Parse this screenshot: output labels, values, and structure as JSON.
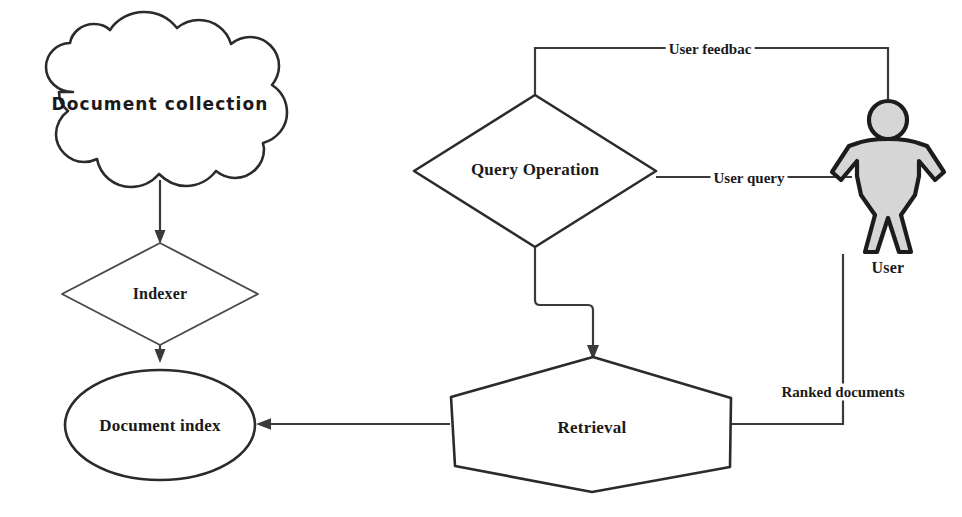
{
  "diagram": {
    "background_color": "#ffffff",
    "stroke_color": "#2b2b2b",
    "person_fill_color": "#d6d6d6",
    "nodes": {
      "document_collection": {
        "label": "Document collection",
        "shape": "cloud"
      },
      "indexer": {
        "label": "Indexer",
        "shape": "diamond"
      },
      "document_index": {
        "label": "Document index",
        "shape": "ellipse"
      },
      "query_operation": {
        "label": "Query Operation",
        "shape": "diamond"
      },
      "retrieval": {
        "label": "Retrieval",
        "shape": "hexagon"
      },
      "user": {
        "label": "User",
        "shape": "person-icon"
      }
    },
    "edges": {
      "user_feedback": {
        "label": "User feedbac"
      },
      "user_query": {
        "label": "User query"
      },
      "ranked_documents": {
        "label": "Ranked documents"
      },
      "collection_to_indexer": {
        "label": ""
      },
      "indexer_to_index": {
        "label": ""
      },
      "retrieval_to_index": {
        "label": ""
      },
      "query_to_retrieval": {
        "label": ""
      }
    }
  }
}
